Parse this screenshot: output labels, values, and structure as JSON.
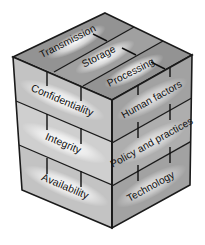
{
  "figure": {
    "name": "mccumber-cube",
    "title": "",
    "background_color": "#ffffff"
  },
  "colors": {
    "outline": "#1a1a1a",
    "top_face": "#9a9a9a",
    "top_face_band": "#8d8d8d",
    "top_face_highlight": "#d8d8d8",
    "left_face": "#c9c9c9",
    "left_face_band": "#bdbdbd",
    "left_face_highlight": "#ededed",
    "right_face": "#a8a8a8",
    "right_face_band": "#9c9c9c",
    "right_face_highlight": "#dedede",
    "tick_mark": "#111111",
    "label_text": "#111111"
  },
  "faces": {
    "top": {
      "name": "information-states",
      "bands": [
        {
          "label": "Transmission"
        },
        {
          "label": "Storage"
        },
        {
          "label": "Processing"
        }
      ]
    },
    "left": {
      "name": "security-services",
      "bands": [
        {
          "label": "Confidentiality"
        },
        {
          "label": "Integrity"
        },
        {
          "label": "Availability"
        }
      ]
    },
    "right": {
      "name": "security-countermeasures",
      "bands": [
        {
          "label": "Human factors"
        },
        {
          "label": "Policy and practices"
        },
        {
          "label": "Technology"
        }
      ]
    }
  }
}
